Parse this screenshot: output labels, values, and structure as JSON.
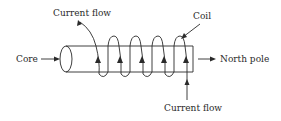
{
  "diagram": {
    "type": "electromagnet-solenoid",
    "labels": {
      "current_flow_top": "Current flow",
      "coil": "Coil",
      "core": "Core",
      "north_pole": "North pole",
      "current_flow_bottom": "Current flow"
    },
    "coil_turns": 5,
    "colors": {
      "line": "#2a2a2a",
      "background": "#ffffff"
    }
  }
}
